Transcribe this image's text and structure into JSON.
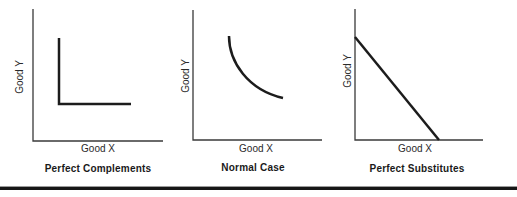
{
  "figure": {
    "panels": [
      {
        "id": "perfect-complements",
        "y_label": "Good Y",
        "x_label": "Good X",
        "caption": "Perfect Complements",
        "curve_type": "l-shaped-right-angle"
      },
      {
        "id": "normal-case",
        "y_label": "Good Y",
        "x_label": "Good X",
        "caption": "Normal Case",
        "curve_type": "convex-to-origin"
      },
      {
        "id": "perfect-substitutes",
        "y_label": "Good Y",
        "x_label": "Good X",
        "caption": "Perfect Substitutes",
        "curve_type": "straight-downward-line"
      }
    ],
    "colors": {
      "curve": "#1c1c1c",
      "axis": "#3a3a3a",
      "label_text": "#2a2a2a",
      "caption_text": "#1a1a1a",
      "rule": "#161616",
      "background": "#ffffff"
    }
  }
}
